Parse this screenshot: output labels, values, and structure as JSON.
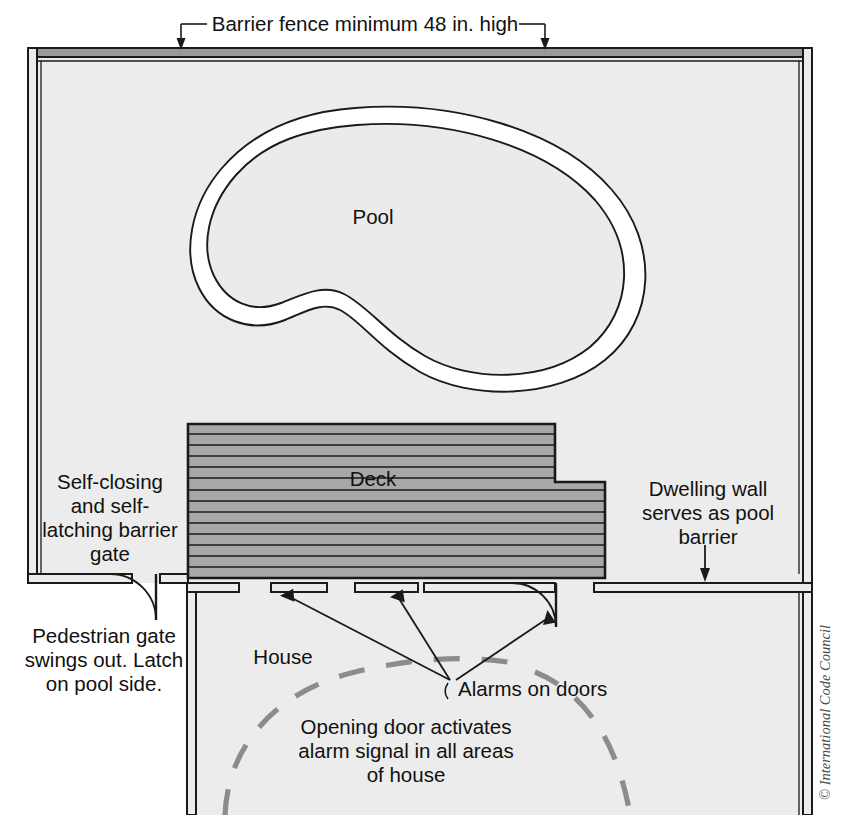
{
  "figure": {
    "copyright": "© International Code Council"
  },
  "labels": {
    "fence_note": "Barrier fence minimum 48 in. high",
    "pool": "Pool",
    "deck": "Deck",
    "house": "House",
    "gate_note_line1": "Self-closing",
    "gate_note_line2": "and self-",
    "gate_note_line3": "latching barrier",
    "gate_note_line4": "gate",
    "pedestrian_line1": "Pedestrian gate",
    "pedestrian_line2": "swings out. Latch",
    "pedestrian_line3": "on pool side.",
    "dwelling_line1": "Dwelling wall",
    "dwelling_line2": "serves as pool",
    "dwelling_line3": "barrier",
    "alarms": "Alarms on doors",
    "alarm_signal_line1": "Opening door activates",
    "alarm_signal_line2": "alarm signal in all areas",
    "alarm_signal_line3": "of house"
  },
  "colors": {
    "background": "#ffffff",
    "yard_fill": "#ececec",
    "pool_water": "#ebebeb",
    "pool_coping": "#ffffff",
    "deck_fill": "#a8a8a8",
    "wall_fill": "#a8a8a8",
    "house_fill": "#ececec",
    "line": "#1a1a1a",
    "dashed_arc": "#8c8c8c",
    "copyright_text": "#4a4a4a"
  },
  "elements": {
    "fence_label": "barrier-fence",
    "pool_label": "swimming-pool",
    "deck_label": "pool-deck",
    "house_label": "house",
    "gate_label": "pedestrian-gate",
    "door_label": "house-door"
  }
}
